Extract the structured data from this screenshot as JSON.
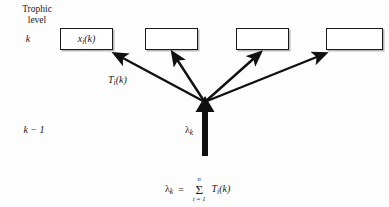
{
  "figure": {
    "background_color": "#fdfdfd",
    "stroke_color": "#1a1a1a"
  },
  "axis": {
    "trophic_label_line1": "Trophic",
    "trophic_label_line2": "level",
    "level_k": "k",
    "level_k_minus_1": "k − 1"
  },
  "boxes": [
    {
      "label_base": "x",
      "label_sub": "i",
      "label_tail": "(k)",
      "empty": false
    },
    {
      "label_base": "",
      "label_sub": "",
      "label_tail": "",
      "empty": true
    },
    {
      "label_base": "",
      "label_sub": "",
      "label_tail": "",
      "empty": true
    },
    {
      "label_base": "",
      "label_sub": "",
      "label_tail": "",
      "empty": true
    }
  ],
  "flows": {
    "transfer_base": "T",
    "transfer_sub": "i",
    "transfer_tail": "(k)",
    "input_base": "λ",
    "input_sub": "k"
  },
  "equation": {
    "lhs_base": "λ",
    "lhs_sub": "k",
    "equals": "=",
    "sigma": "Σ",
    "sum_upper": "n",
    "sum_lower": "i = 1",
    "term_base": "T",
    "term_sub": "i",
    "term_tail": "(k)"
  }
}
